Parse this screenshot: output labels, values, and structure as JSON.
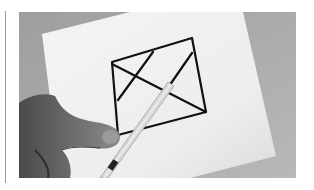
{
  "image": {
    "description": "Black-and-white photo of a hand holding scissors cutting along a line on a sheet of paper with a quadrilateral drawn on it, divided by a diagonal and two inner lines",
    "colors": {
      "background": "#a9a9a9",
      "paper": "#f2f2f2",
      "ink": "#111111",
      "hand": "#6e6e6e",
      "scissors": "#d8d8d8",
      "rule": "#9a9a9a"
    }
  }
}
